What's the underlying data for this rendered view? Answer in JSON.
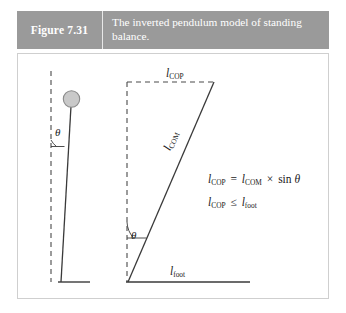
{
  "figure": {
    "number_label": "Figure 7.31",
    "caption": "The inverted pendulum model of standing balance.",
    "header_bg": "#9a9a9a",
    "header_text_color": "#ffffff",
    "panel_border_color": "#cfcfcf",
    "panel_bg": "#ffffff"
  },
  "diagram": {
    "stroke_color": "#3a3a3a",
    "dash_color": "#4a4a4a",
    "mass_fill": "#c9c9c9",
    "mass_stroke": "#8a8a8a",
    "labels": {
      "l_cop": {
        "symbol": "l",
        "subscript": "COP"
      },
      "l_com": {
        "symbol": "l",
        "subscript": "COM"
      },
      "l_foot": {
        "symbol": "l",
        "subscript": "foot"
      },
      "theta_left": "θ",
      "theta_right": "θ"
    },
    "left_pendulum": {
      "name": "inverted-pendulum-with-mass",
      "has_mass_circle": true,
      "has_vertical_reference": true,
      "has_foot_base": true,
      "angle_symbol": "θ"
    },
    "right_pendulum": {
      "name": "inverted-pendulum-geometry",
      "has_vertical_reference": true,
      "has_cop_horizontal": true,
      "has_foot_baseline": true,
      "angle_symbol": "θ"
    }
  },
  "equations": [
    {
      "id": "eq-lcop-definition",
      "lhs": {
        "symbol": "l",
        "subscript": "COP"
      },
      "relation": "=",
      "rhs_symbol": {
        "symbol": "l",
        "subscript": "COM"
      },
      "operator": "×",
      "function": "sin",
      "argument": "θ",
      "plain": "l_COP = l_COM × sin θ"
    },
    {
      "id": "eq-lcop-constraint",
      "lhs": {
        "symbol": "l",
        "subscript": "COP"
      },
      "relation": "≤",
      "rhs_symbol": {
        "symbol": "l",
        "subscript": "foot"
      },
      "plain": "l_COP ≤ l_foot"
    }
  ]
}
